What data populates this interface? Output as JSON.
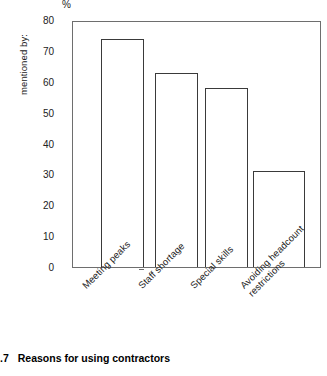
{
  "chart_data": {
    "type": "bar",
    "title": "",
    "caption_number": ".7",
    "caption_text": "Reasons for using contractors",
    "unit_label": "%",
    "xlabel": "",
    "ylabel": "mentioned by:",
    "ylim": [
      0,
      80
    ],
    "ytick_step": 10,
    "grid": false,
    "legend": false,
    "yticks": [
      {
        "value": 80,
        "label": "80"
      },
      {
        "value": 70,
        "label": "70"
      },
      {
        "value": 60,
        "label": "60"
      },
      {
        "value": 50,
        "label": "50"
      },
      {
        "value": 40,
        "label": "40"
      },
      {
        "value": 30,
        "label": "30"
      },
      {
        "value": 20,
        "label": "20"
      },
      {
        "value": 10,
        "label": "10"
      },
      {
        "value": 0,
        "label": "0"
      }
    ],
    "categories": [
      "Meeting peaks",
      "Staff shortage",
      "Special skills",
      "Avoiding headcount restrictions"
    ],
    "category_lines": [
      [
        "Meeting peaks"
      ],
      [
        "Staff shortage"
      ],
      [
        "Special skills"
      ],
      [
        "Avoiding headcount",
        "restrictions"
      ]
    ],
    "values": [
      74,
      63,
      58,
      31
    ],
    "bar_color": "#ffffff",
    "bar_edge_color": "#3a3a3a",
    "axis_color": "#6e6e6e"
  }
}
